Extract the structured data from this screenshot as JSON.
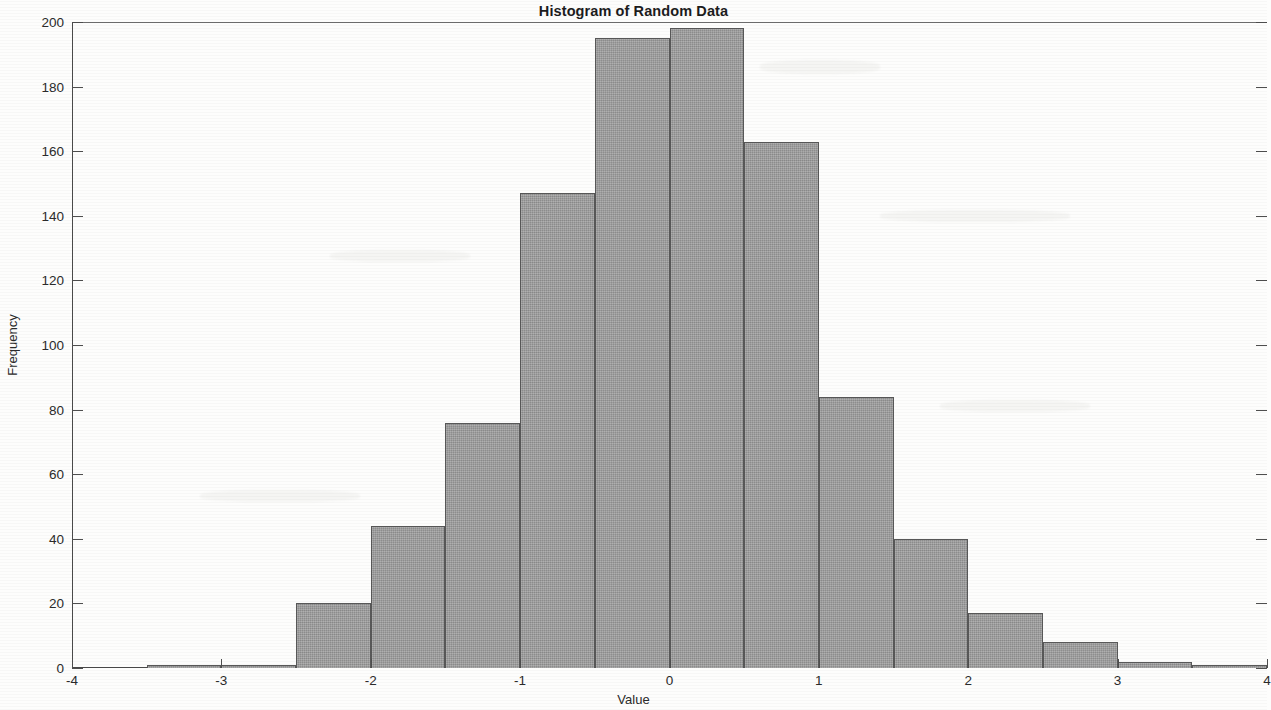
{
  "chart_data": {
    "type": "bar",
    "title": "Histogram of Random Data",
    "xlabel": "Value",
    "ylabel": "Frequency",
    "xlim": [
      -4,
      4
    ],
    "ylim": [
      0,
      200
    ],
    "grid": false,
    "legend": null,
    "bin_width": 0.5,
    "bin_edges": [
      -3.5,
      -3.0,
      -2.5,
      -2.0,
      -1.5,
      -1.0,
      -0.5,
      0.0,
      0.5,
      1.0,
      1.5,
      2.0,
      2.5,
      3.0,
      3.5,
      4.0
    ],
    "categories": [
      "-3.5 to -3.0",
      "-3.0 to -2.5",
      "-2.5 to -2.0",
      "-2.0 to -1.5",
      "-1.5 to -1.0",
      "-1.0 to -0.5",
      "-0.5 to 0.0",
      "0.0 to 0.5",
      "0.5 to 1.0",
      "1.0 to 1.5",
      "1.5 to 2.0",
      "2.0 to 2.5",
      "2.5 to 3.0",
      "3.0 to 3.5",
      "3.5 to 4.0"
    ],
    "values": [
      1,
      1,
      20,
      44,
      76,
      147,
      195,
      198,
      163,
      84,
      40,
      17,
      8,
      2,
      1
    ],
    "x_ticks": [
      -4,
      -3,
      -2,
      -1,
      0,
      1,
      2,
      3,
      4
    ],
    "x_tick_labels": [
      "-4",
      "-3",
      "-2",
      "-1",
      "0",
      "1",
      "2",
      "3",
      "4"
    ],
    "y_ticks": [
      0,
      20,
      40,
      60,
      80,
      100,
      120,
      140,
      160,
      180,
      200
    ],
    "y_tick_labels": [
      "0",
      "20",
      "40",
      "60",
      "80",
      "100",
      "120",
      "140",
      "160",
      "180",
      "200"
    ],
    "bar_fill_color": "#9d9d9d",
    "bar_edge_color": "#585858",
    "axis_color": "#4a4a4a",
    "background_color": "#fdfdfc"
  }
}
